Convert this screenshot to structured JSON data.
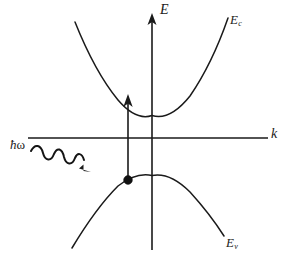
{
  "figure": {
    "kind": "E-k band diagram",
    "background_color": "#ffffff",
    "ink_color": "#1a1a1a",
    "width": 292,
    "height": 262
  },
  "axes": {
    "vertical": {
      "label": "E",
      "name": "energy-axis",
      "x": 152,
      "top_y": 14,
      "bottom_y": 250,
      "has_arrow_head": true,
      "arrow_at": "top"
    },
    "horizontal": {
      "label": "k",
      "name": "wavevector-axis",
      "y": 138,
      "left_x": 28,
      "right_x": 268,
      "has_arrow_head": false
    }
  },
  "bands": {
    "conduction": {
      "label": "E",
      "subscript": "c",
      "shape": "upward-parabola",
      "vertex": [
        152,
        115
      ],
      "left_end": [
        75,
        22
      ],
      "right_end": [
        228,
        18
      ]
    },
    "valence": {
      "label": "E",
      "subscript": "v",
      "shape": "downward-parabola",
      "vertex": [
        152,
        175
      ],
      "left_end": [
        72,
        248
      ],
      "right_end": [
        224,
        236
      ]
    }
  },
  "transition": {
    "name": "vertical-optical-transition",
    "arrow_from": [
      128,
      180
    ],
    "arrow_to": [
      128,
      96
    ],
    "description": "vertical arrow"
  },
  "electron": {
    "name": "electron-state-dot",
    "position": [
      128,
      180
    ],
    "radius": 4.4
  },
  "photon": {
    "label_hbar": "ħ",
    "label_omega": "ω",
    "label_full": "ħω",
    "wave_start": [
      30,
      152
    ],
    "wave_end": [
      88,
      174
    ],
    "oscillations": 4,
    "has_arrow_head": true
  }
}
